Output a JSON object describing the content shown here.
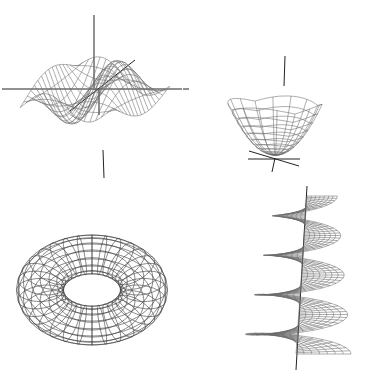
{
  "figure": {
    "background": "#ffffff",
    "line_color": "#6a6a6a",
    "axis_color": "#222222",
    "panels": [
      {
        "id": "wave-surface",
        "label": "Wavy saddle surface wireframe",
        "position": "top-left"
      },
      {
        "id": "paraboloid",
        "label": "Paraboloid wireframe",
        "position": "top-right"
      },
      {
        "id": "torus",
        "label": "Torus wireframe",
        "position": "bottom-left"
      },
      {
        "id": "helicoid",
        "label": "Helicoid wireframe",
        "position": "bottom-right"
      }
    ]
  }
}
